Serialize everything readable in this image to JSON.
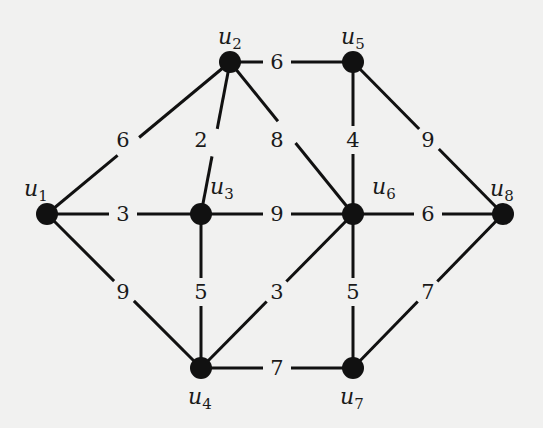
{
  "diagram": {
    "type": "weighted-undirected-graph",
    "background_color": "#f1f1f0",
    "ink_color": "#111111",
    "nodes": [
      {
        "id": "u1",
        "base": "u",
        "sub": "1",
        "x": 47,
        "y": 214,
        "label_x": 24,
        "label_y": 196
      },
      {
        "id": "u2",
        "base": "u",
        "sub": "2",
        "x": 230,
        "y": 62,
        "label_x": 218,
        "label_y": 44
      },
      {
        "id": "u3",
        "base": "u",
        "sub": "3",
        "x": 201,
        "y": 214,
        "label_x": 210,
        "label_y": 194
      },
      {
        "id": "u4",
        "base": "u",
        "sub": "4",
        "x": 201,
        "y": 368,
        "label_x": 188,
        "label_y": 404
      },
      {
        "id": "u5",
        "base": "u",
        "sub": "5",
        "x": 353,
        "y": 62,
        "label_x": 341,
        "label_y": 44
      },
      {
        "id": "u6",
        "base": "u",
        "sub": "6",
        "x": 353,
        "y": 214,
        "label_x": 372,
        "label_y": 194
      },
      {
        "id": "u7",
        "base": "u",
        "sub": "7",
        "x": 353,
        "y": 368,
        "label_x": 340,
        "label_y": 404
      },
      {
        "id": "u8",
        "base": "u",
        "sub": "8",
        "x": 503,
        "y": 214,
        "label_x": 490,
        "label_y": 196
      }
    ],
    "edges": [
      {
        "from": "u1",
        "to": "u2",
        "weight": "6",
        "lx": 123,
        "ly": 140
      },
      {
        "from": "u1",
        "to": "u3",
        "weight": "3",
        "lx": 123,
        "ly": 214
      },
      {
        "from": "u1",
        "to": "u4",
        "weight": "9",
        "lx": 123,
        "ly": 292
      },
      {
        "from": "u2",
        "to": "u3",
        "weight": "2",
        "lx": 201,
        "ly": 140
      },
      {
        "from": "u2",
        "to": "u5",
        "weight": "6",
        "lx": 277,
        "ly": 62
      },
      {
        "from": "u2",
        "to": "u6",
        "weight": "8",
        "lx": 277,
        "ly": 140
      },
      {
        "from": "u3",
        "to": "u6",
        "weight": "9",
        "lx": 277,
        "ly": 214
      },
      {
        "from": "u3",
        "to": "u4",
        "weight": "5",
        "lx": 201,
        "ly": 292
      },
      {
        "from": "u4",
        "to": "u6",
        "weight": "3",
        "lx": 277,
        "ly": 292
      },
      {
        "from": "u4",
        "to": "u7",
        "weight": "7",
        "lx": 277,
        "ly": 368
      },
      {
        "from": "u5",
        "to": "u6",
        "weight": "4",
        "lx": 353,
        "ly": 140
      },
      {
        "from": "u5",
        "to": "u8",
        "weight": "9",
        "lx": 428,
        "ly": 140
      },
      {
        "from": "u6",
        "to": "u8",
        "weight": "6",
        "lx": 428,
        "ly": 214
      },
      {
        "from": "u6",
        "to": "u7",
        "weight": "5",
        "lx": 353,
        "ly": 292
      },
      {
        "from": "u7",
        "to": "u8",
        "weight": "7",
        "lx": 428,
        "ly": 292
      }
    ]
  }
}
